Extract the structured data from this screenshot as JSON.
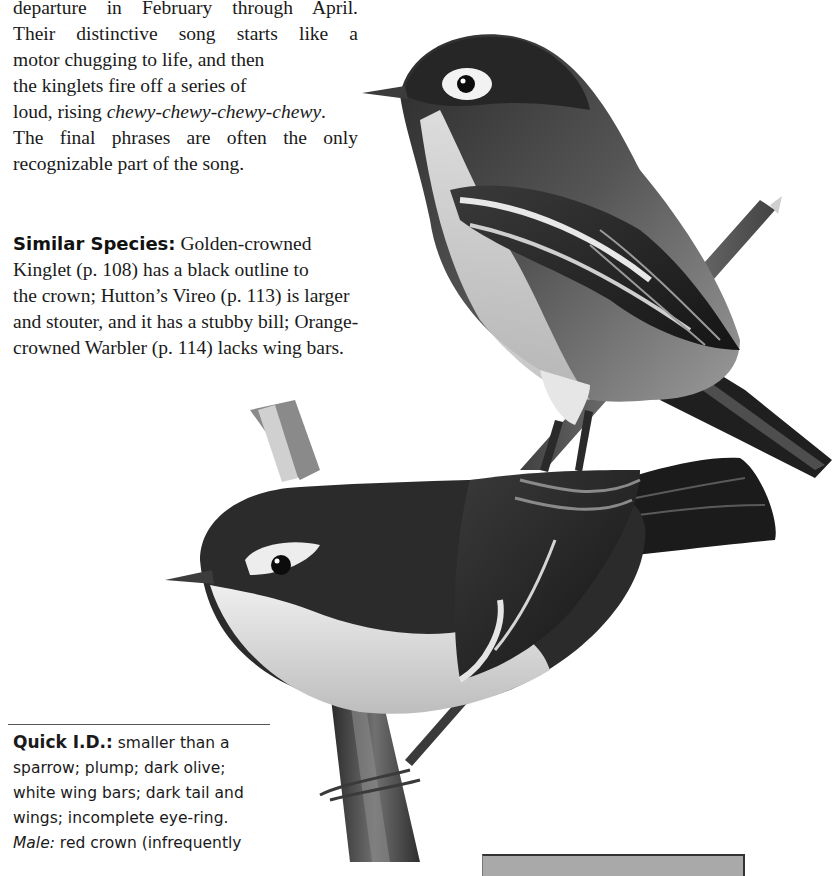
{
  "song_paragraph": {
    "lines": [
      "departure in February through April.",
      "Their distinctive song starts like a",
      "motor chugging to life, and then",
      "the kinglets fire off a series of",
      "loud, rising ",
      "The final phrases are often the only",
      "recognizable part of the song."
    ],
    "song_italic": "chewy-chewy-chewy-chewy",
    "song_after": "."
  },
  "similar_species": {
    "label": "Similar Species:",
    "lines": [
      " Golden-crowned",
      "Kinglet (p. 108) has a black outline to",
      "the crown; Hutton’s Vireo (p. 113) is larger",
      "and stouter, and it has a stubby bill; Orange-",
      "crowned Warbler (p. 114) lacks wing bars."
    ]
  },
  "quick_id": {
    "label": "Quick I.D.:",
    "lines": [
      " smaller than a",
      "sparrow; plump; dark olive;",
      "white wing bars; dark tail and",
      "wings; incomplete eye-ring."
    ],
    "male_label": "Male:",
    "male_text": " red crown (infrequently"
  },
  "illustration": {
    "subject": "two kinglets perched on branches",
    "style": "grayscale pencil drawing",
    "colors": {
      "dark": "#1c1c1c",
      "mid": "#6b6b6b",
      "light": "#d9d9d9",
      "pale": "#f2f2f2"
    }
  },
  "gray_box": {
    "fill": "#a9a9a9",
    "border": "#333333"
  }
}
